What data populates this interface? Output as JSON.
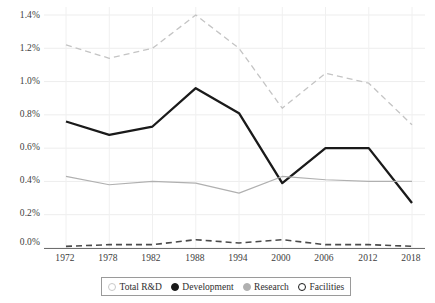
{
  "chart_data": {
    "type": "line",
    "title": "",
    "xlabel": "",
    "ylabel": "",
    "x": [
      1972,
      1978,
      1982,
      1988,
      1994,
      2000,
      2006,
      2012,
      2018
    ],
    "categories": [
      "1972",
      "1978",
      "1982",
      "1988",
      "1994",
      "2000",
      "2006",
      "2012",
      "2018"
    ],
    "ylim": [
      0.0,
      1.4
    ],
    "ytick_labels": [
      "0.0%",
      "0.2%",
      "0.4%",
      "0.6%",
      "0.8%",
      "1.0%",
      "1.2%",
      "1.4%"
    ],
    "ytick_values": [
      0.0,
      0.2,
      0.4,
      0.6,
      0.8,
      1.0,
      1.2,
      1.4
    ],
    "grid": true,
    "legend_position": "bottom",
    "units": "percent of GDP",
    "series": [
      {
        "name": "Total R&D",
        "values": [
          1.22,
          1.14,
          1.2,
          1.4,
          1.2,
          0.84,
          1.05,
          0.99,
          0.74
        ],
        "style": "dashed",
        "color": "#c4c4c4",
        "marker": "open-circle-light"
      },
      {
        "name": "Development",
        "values": [
          0.76,
          0.68,
          0.73,
          0.96,
          0.81,
          0.39,
          0.6,
          0.6,
          0.27
        ],
        "style": "solid",
        "color": "#1a1a1a",
        "marker": "filled-circle"
      },
      {
        "name": "Research",
        "values": [
          0.43,
          0.38,
          0.4,
          0.39,
          0.33,
          0.43,
          0.41,
          0.4,
          0.4
        ],
        "style": "solid",
        "color": "#b0b0b0",
        "marker": "filled-circle-grey"
      },
      {
        "name": "Facilities",
        "values": [
          0.01,
          0.02,
          0.02,
          0.05,
          0.03,
          0.05,
          0.02,
          0.02,
          0.01
        ],
        "style": "dashed",
        "color": "#4a4a4a",
        "marker": "open-circle-dark"
      }
    ]
  },
  "legend": {
    "items": [
      {
        "label": "Total R&D",
        "marker_class": "m-totalrd"
      },
      {
        "label": "Development",
        "marker_class": "m-development"
      },
      {
        "label": "Research",
        "marker_class": "m-research"
      },
      {
        "label": "Facilities",
        "marker_class": "m-facilities"
      }
    ]
  },
  "axes": {
    "y_labels": [
      "1.4%",
      "1.2%",
      "1.0%",
      "0.8%",
      "0.6%",
      "0.4%",
      "0.2%",
      "0.0%"
    ],
    "x_labels": [
      "1972",
      "1978",
      "1982",
      "1988",
      "1994",
      "2000",
      "2006",
      "2012",
      "2018"
    ]
  }
}
